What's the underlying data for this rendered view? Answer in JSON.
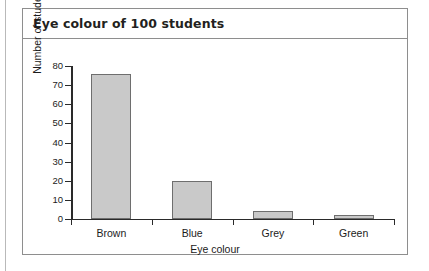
{
  "card": {
    "title": "Eye colour of 100 students"
  },
  "chart_data": {
    "type": "bar",
    "title": "Eye colour of 100 students",
    "xlabel": "Eye colour",
    "ylabel": "Number of students",
    "categories": [
      "Brown",
      "Blue",
      "Grey",
      "Green"
    ],
    "values": [
      76,
      20,
      4,
      2
    ],
    "ylim": [
      0,
      80
    ],
    "ytick_labels": [
      "0",
      "10",
      "20",
      "30",
      "40",
      "50",
      "60",
      "70",
      "80"
    ],
    "ytick_values": [
      0,
      10,
      20,
      30,
      40,
      50,
      60,
      70,
      80
    ],
    "grid": false,
    "legend": null,
    "bar_fill_color": "#c9c9c9",
    "bar_border_color": "#6e6e6e",
    "axis_color": "#2a2a2a"
  }
}
